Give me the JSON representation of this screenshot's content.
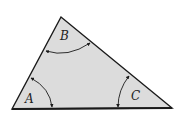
{
  "diagram": {
    "type": "triangle",
    "fill_color": "#dcdcdc",
    "stroke_color": "#1a1a1a",
    "vertices": {
      "A": [
        12,
        109
      ],
      "B": [
        61,
        17
      ],
      "C": [
        172,
        108
      ]
    },
    "angles": [
      {
        "label": "A",
        "position": "bottom-left"
      },
      {
        "label": "B",
        "position": "top"
      },
      {
        "label": "C",
        "position": "bottom-right"
      }
    ]
  }
}
